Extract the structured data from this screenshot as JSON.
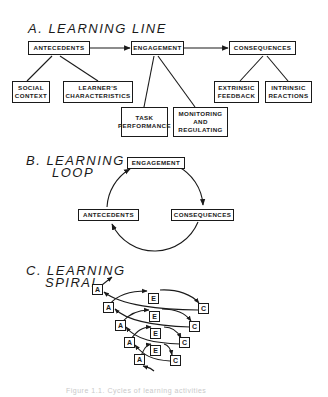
{
  "sections": {
    "line": {
      "title": "A. LEARNING LINE",
      "main_nodes": [
        "Antecedents",
        "Engagement",
        "Consequences"
      ],
      "antecedents_children": [
        "Social\nContext",
        "Learner's\nCharacteristics"
      ],
      "social_context": "Social Context",
      "learners_characteristics": "Learner's Characteristics",
      "task_performance": "Task Performance",
      "monitoring_regulating": "Monitoring and Regulating",
      "extrinsic_feedback": "Extrinsic Feedback",
      "intrinsic_reactions": "Intrinsic Reactions"
    },
    "loop": {
      "title_line1": "B. LEARNING",
      "title_line2": "LOOP",
      "engagement": "Engagement",
      "antecedents": "Antecedents",
      "consequences": "Consequences"
    },
    "spiral": {
      "title_line1": "C. LEARNING",
      "title_line2": "SPIRAL",
      "a_label": "A",
      "e_label": "E",
      "c_label": "C"
    }
  },
  "labels": {
    "social": "Social",
    "context": "Context",
    "learners": "Learner's",
    "characteristics": "Characteristics",
    "task": "Task",
    "performance": "Performance",
    "monitoring": "Monitoring",
    "and": "and",
    "regulating": "Regulating",
    "extrinsic": "Extrinsic",
    "feedback": "Feedback",
    "intrinsic": "Intrinsic",
    "reactions": "Reactions"
  },
  "caption": "Figure 1.1. Cycles of learning activities"
}
